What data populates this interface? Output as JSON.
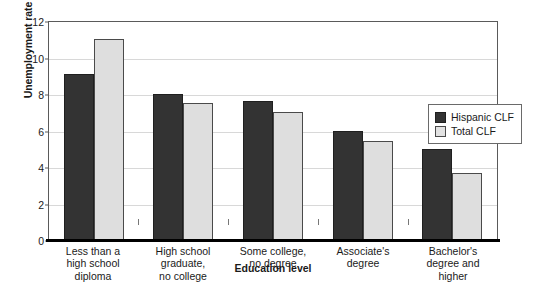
{
  "chart_data": {
    "type": "bar",
    "title": "",
    "xlabel": "Education level",
    "ylabel": "Unemployment rate",
    "ylim": [
      0,
      12
    ],
    "yticks": [
      0,
      2,
      4,
      6,
      8,
      10,
      12
    ],
    "grid": true,
    "legend_position": "right",
    "categories": [
      "Less than a high school diploma",
      "High school graduate, no college",
      "Some college, no degree",
      "Associate's degree",
      "Bachelor's degree and higher"
    ],
    "category_lines": [
      [
        "Less than a",
        "high school",
        "diploma"
      ],
      [
        "High school",
        "graduate,",
        "no college"
      ],
      [
        "Some college,",
        "no degree"
      ],
      [
        "Associate's",
        "degree"
      ],
      [
        "Bachelor's",
        "degree and",
        "higher"
      ]
    ],
    "series": [
      {
        "name": "Hispanic CLF",
        "color": "#333333",
        "values": [
          9.1,
          8.0,
          7.6,
          5.95,
          5.0
        ]
      },
      {
        "name": "Total CLF",
        "color": "#dedede",
        "values": [
          11.0,
          7.5,
          7.0,
          5.45,
          3.65
        ]
      }
    ]
  },
  "legend": {
    "items": [
      {
        "label": "Hispanic CLF"
      },
      {
        "label": "Total CLF"
      }
    ]
  }
}
